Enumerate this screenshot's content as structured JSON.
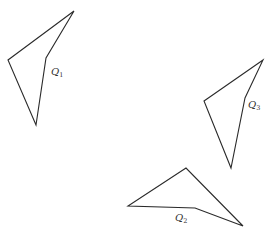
{
  "diagram": {
    "width": 278,
    "height": 230,
    "stroke_color": "#2a2a2a",
    "background": "#ffffff",
    "shapes": [
      {
        "id": "Q1",
        "label_main": "Q",
        "label_sub": "1",
        "points": "74,11 8,60 36,125 46,58",
        "label_pos": {
          "x": 51,
          "y": 75
        }
      },
      {
        "id": "Q2",
        "label_main": "Q",
        "label_sub": "2",
        "points": "186,168 128,206 195,208 243,226",
        "label_pos": {
          "x": 175,
          "y": 221
        }
      },
      {
        "id": "Q3",
        "label_main": "Q",
        "label_sub": "3",
        "points": "263,60 204,101 231,168 245,98",
        "label_pos": {
          "x": 248,
          "y": 108
        }
      }
    ]
  }
}
